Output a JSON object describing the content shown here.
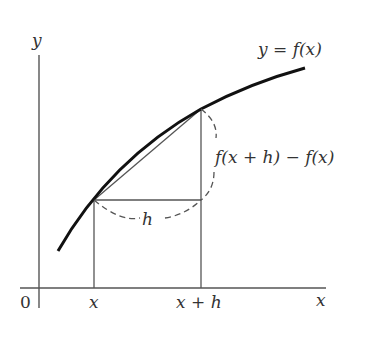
{
  "diagram": {
    "axes": {
      "x_label": "x",
      "y_label": "y",
      "origin_label": "0"
    },
    "curve_label": "y = f(x)",
    "tick_labels": {
      "x": "x",
      "x_plus_h": "x + h"
    },
    "run_label": "h",
    "rise_label": "f(x + h) − f(x)",
    "colors": {
      "curve": "#111111",
      "lines": "#444444",
      "text": "#333333"
    }
  }
}
